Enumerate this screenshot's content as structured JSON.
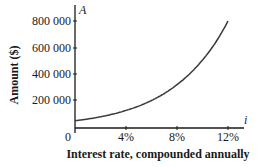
{
  "chart_data": {
    "type": "line",
    "title": "",
    "xlabel": "Interest rate, compounded annually",
    "ylabel": "Amount ($)",
    "x_axis_variable": "i",
    "y_axis_variable": "A",
    "x_ticks": [
      "0",
      "4%",
      "8%",
      "12%"
    ],
    "x_tick_values": [
      0,
      4,
      8,
      12
    ],
    "y_ticks": [
      "200 000",
      "400 000",
      "600 000",
      "800 000"
    ],
    "y_tick_values": [
      200000,
      400000,
      600000,
      800000
    ],
    "xlim": [
      0,
      13.5
    ],
    "ylim": [
      0,
      880000
    ],
    "grid": false,
    "legend": null,
    "series": [
      {
        "name": "A",
        "x": [
          0,
          1,
          2,
          3,
          4,
          5,
          6,
          7,
          8,
          9,
          10,
          11,
          12
        ],
        "values": [
          47000,
          60000,
          77000,
          98000,
          125000,
          158000,
          200000,
          253000,
          319000,
          402000,
          505000,
          634000,
          800000
        ],
        "estimated": true,
        "note": "Anchored only by visible endpoints: A(0%) read as ~47,000 and A(12%) read as ~800,000. Intermediate values are a smooth exponential interpolation, not read from the figure; the chart does not label principal or term."
      }
    ],
    "colors": {
      "axis": "#1a1a1a",
      "curve": "#3a3a3a"
    }
  }
}
